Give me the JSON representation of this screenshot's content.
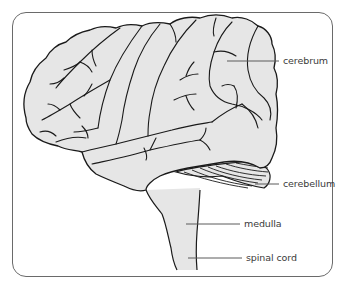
{
  "diagram": {
    "title": "",
    "colors": {
      "frame_border": "#6a6a6a",
      "brain_fill": "#e6e6e6",
      "outline": "#1a1a1a",
      "leader_line": "#5a5a5a",
      "label_text": "#3a3a3a"
    },
    "labels": [
      {
        "id": "cerebrum",
        "text": "cerebrum",
        "x": 283,
        "y": 55
      },
      {
        "id": "cerebellum",
        "text": "cerebellum",
        "x": 283,
        "y": 178
      },
      {
        "id": "medulla",
        "text": "medulla",
        "x": 244,
        "y": 219
      },
      {
        "id": "spinal-cord",
        "text": "spinal cord",
        "x": 246,
        "y": 254
      }
    ]
  }
}
